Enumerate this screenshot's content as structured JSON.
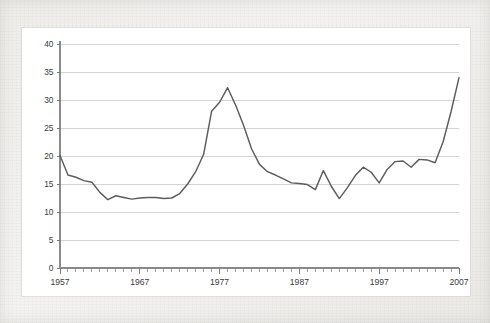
{
  "chart_data": {
    "type": "line",
    "title": "",
    "subtitle": "",
    "xlabel": "",
    "ylabel": "",
    "xlim": [
      1957,
      2007
    ],
    "ylim": [
      0,
      40
    ],
    "grid": true,
    "legend": false,
    "legend_position": "none",
    "y_ticks": [
      0,
      5,
      10,
      15,
      20,
      25,
      30,
      35,
      40
    ],
    "y_tick_labels": [
      "0",
      "5",
      "10",
      "15",
      "20",
      "25",
      "30",
      "35",
      "40"
    ],
    "x_ticks": [
      1957,
      1967,
      1977,
      1987,
      1997,
      2007
    ],
    "x_tick_labels": [
      "1957",
      "1967",
      "1977",
      "1987",
      "1997",
      "2007"
    ],
    "x_minor_tick_interval": 1,
    "series": [
      {
        "name": "series-1",
        "color": "#5c5c5c",
        "x": [
          1957,
          1958,
          1959,
          1960,
          1961,
          1962,
          1963,
          1964,
          1965,
          1966,
          1967,
          1968,
          1969,
          1970,
          1971,
          1972,
          1973,
          1974,
          1975,
          1976,
          1977,
          1978,
          1979,
          1980,
          1981,
          1982,
          1983,
          1984,
          1985,
          1986,
          1987,
          1988,
          1989,
          1990,
          1991,
          1992,
          1993,
          1994,
          1995,
          1996,
          1997,
          1998,
          1999,
          2000,
          2001,
          2002,
          2003,
          2004,
          2005,
          2006,
          2007
        ],
        "values": [
          20.1,
          16.6,
          16.2,
          15.6,
          15.3,
          13.5,
          12.2,
          12.9,
          12.6,
          12.3,
          12.5,
          12.6,
          12.6,
          12.4,
          12.5,
          13.3,
          15.0,
          17.2,
          20.3,
          28.0,
          29.6,
          32.2,
          29.1,
          25.5,
          21.3,
          18.5,
          17.2,
          16.6,
          15.9,
          15.2,
          15.1,
          14.9,
          14.0,
          17.4,
          14.6,
          12.4,
          14.3,
          16.5,
          18.0,
          17.1,
          15.2,
          17.6,
          19.0,
          19.1,
          18.0,
          19.4,
          19.3,
          18.8,
          22.5,
          27.9,
          34.0
        ]
      }
    ]
  }
}
